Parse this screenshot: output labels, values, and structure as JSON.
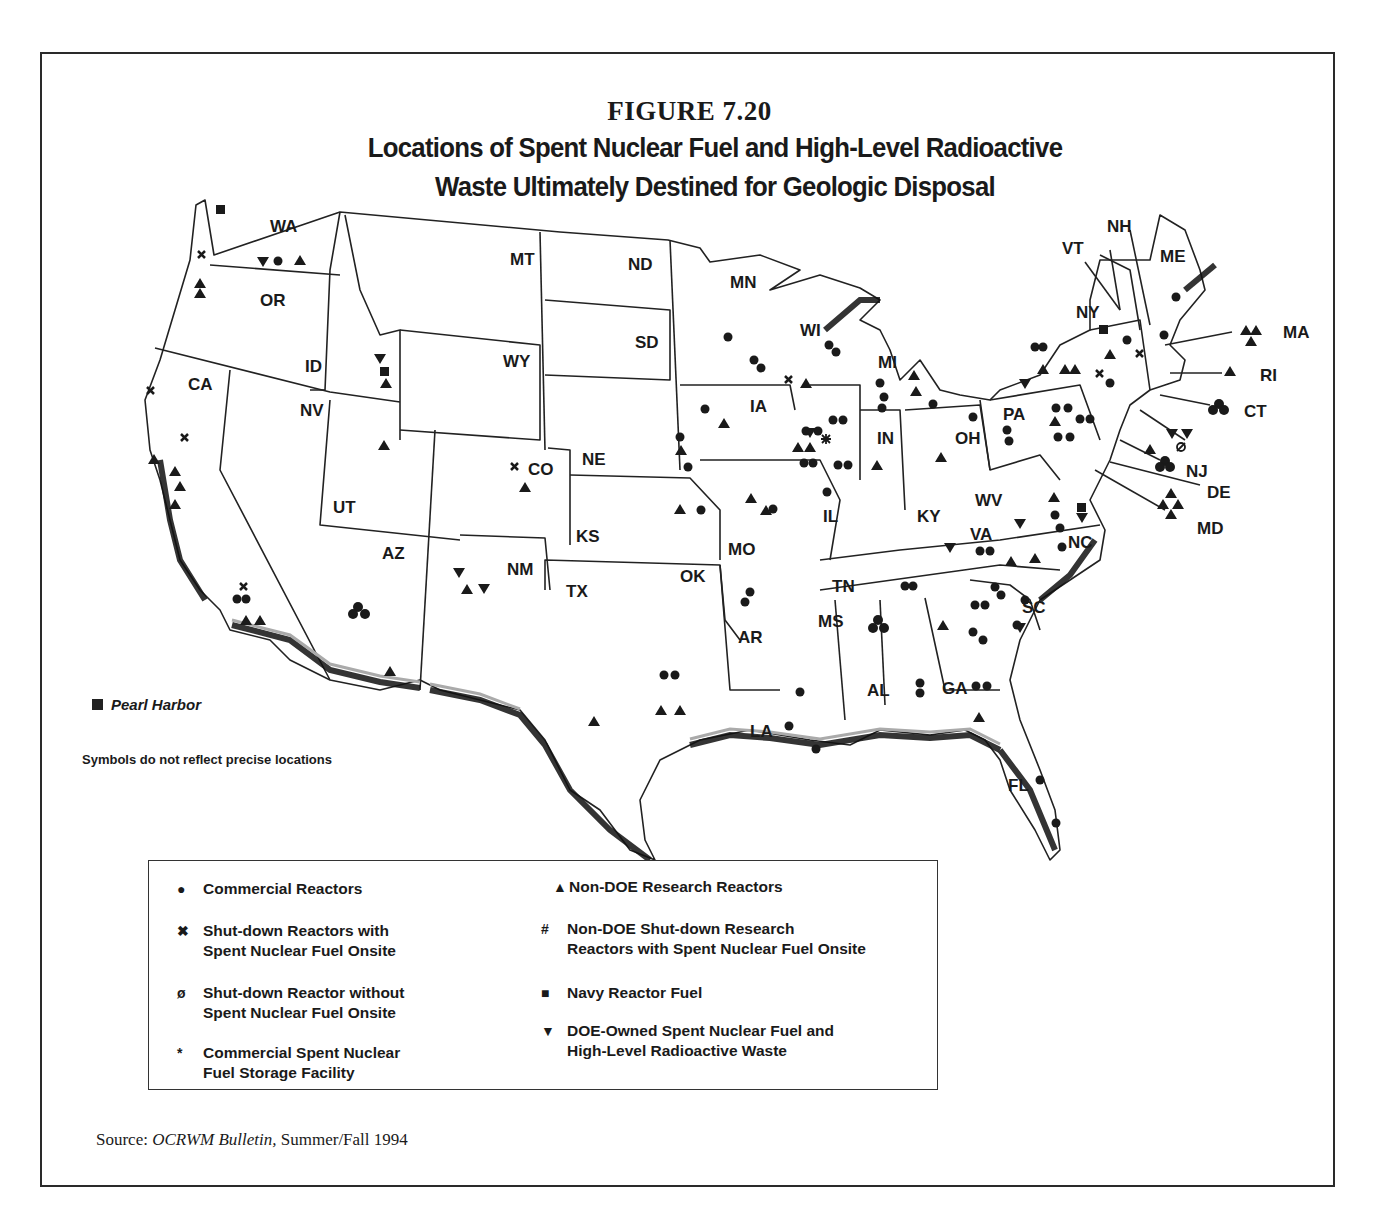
{
  "figure": {
    "number": "FIGURE 7.20",
    "title_line1": "Locations of Spent Nuclear Fuel and High-Level Radioactive",
    "title_line2": "Waste Ultimately Destined for Geologic Disposal"
  },
  "map": {
    "state_labels": [
      {
        "abbr": "WA",
        "x": 270,
        "y": 232
      },
      {
        "abbr": "OR",
        "x": 260,
        "y": 306
      },
      {
        "abbr": "CA",
        "x": 188,
        "y": 390
      },
      {
        "abbr": "ID",
        "x": 305,
        "y": 372
      },
      {
        "abbr": "NV",
        "x": 300,
        "y": 416
      },
      {
        "abbr": "MT",
        "x": 510,
        "y": 265
      },
      {
        "abbr": "WY",
        "x": 503,
        "y": 367
      },
      {
        "abbr": "UT",
        "x": 333,
        "y": 513
      },
      {
        "abbr": "AZ",
        "x": 382,
        "y": 559
      },
      {
        "abbr": "CO",
        "x": 528,
        "y": 475
      },
      {
        "abbr": "NM",
        "x": 507,
        "y": 575
      },
      {
        "abbr": "ND",
        "x": 628,
        "y": 270
      },
      {
        "abbr": "SD",
        "x": 635,
        "y": 348
      },
      {
        "abbr": "NE",
        "x": 582,
        "y": 465
      },
      {
        "abbr": "KS",
        "x": 576,
        "y": 542
      },
      {
        "abbr": "OK",
        "x": 680,
        "y": 582
      },
      {
        "abbr": "TX",
        "x": 566,
        "y": 597
      },
      {
        "abbr": "MN",
        "x": 730,
        "y": 288
      },
      {
        "abbr": "IA",
        "x": 750,
        "y": 412
      },
      {
        "abbr": "MO",
        "x": 728,
        "y": 555
      },
      {
        "abbr": "AR",
        "x": 738,
        "y": 643
      },
      {
        "abbr": "LA",
        "x": 750,
        "y": 737
      },
      {
        "abbr": "WI",
        "x": 800,
        "y": 336
      },
      {
        "abbr": "IL",
        "x": 823,
        "y": 522
      },
      {
        "abbr": "MI",
        "x": 878,
        "y": 368
      },
      {
        "abbr": "IN",
        "x": 877,
        "y": 444
      },
      {
        "abbr": "MS",
        "x": 818,
        "y": 627
      },
      {
        "abbr": "TN",
        "x": 832,
        "y": 592
      },
      {
        "abbr": "AL",
        "x": 867,
        "y": 696
      },
      {
        "abbr": "KY",
        "x": 917,
        "y": 522
      },
      {
        "abbr": "OH",
        "x": 955,
        "y": 444
      },
      {
        "abbr": "GA",
        "x": 942,
        "y": 694
      },
      {
        "abbr": "FL",
        "x": 1008,
        "y": 791
      },
      {
        "abbr": "WV",
        "x": 975,
        "y": 506
      },
      {
        "abbr": "VA",
        "x": 970,
        "y": 540
      },
      {
        "abbr": "NC",
        "x": 1068,
        "y": 548
      },
      {
        "abbr": "SC",
        "x": 1022,
        "y": 613
      },
      {
        "abbr": "PA",
        "x": 1003,
        "y": 420
      },
      {
        "abbr": "NY",
        "x": 1076,
        "y": 318
      },
      {
        "abbr": "VT",
        "x": 1062,
        "y": 254
      },
      {
        "abbr": "NH",
        "x": 1107,
        "y": 232
      },
      {
        "abbr": "ME",
        "x": 1160,
        "y": 262
      },
      {
        "abbr": "MA",
        "x": 1283,
        "y": 338
      },
      {
        "abbr": "RI",
        "x": 1260,
        "y": 381
      },
      {
        "abbr": "CT",
        "x": 1244,
        "y": 417
      },
      {
        "abbr": "NJ",
        "x": 1186,
        "y": 477
      },
      {
        "abbr": "DE",
        "x": 1207,
        "y": 498
      },
      {
        "abbr": "MD",
        "x": 1197,
        "y": 534
      }
    ],
    "pearl_harbor_label": "Pearl Harbor",
    "disclaimer": "Symbols do not reflect precise locations"
  },
  "legend": {
    "items": [
      {
        "symbol": "●",
        "icon": "circle-icon",
        "label_line1": "Commercial Reactors",
        "label_line2": ""
      },
      {
        "symbol": "✖",
        "icon": "x-icon",
        "label_line1": "Shut-down Reactors with",
        "label_line2": "Spent Nuclear Fuel Onsite"
      },
      {
        "symbol": "ø",
        "icon": "slashed-circle-icon",
        "label_line1": "Shut-down Reactor without",
        "label_line2": "Spent Nuclear Fuel Onsite"
      },
      {
        "symbol": "*",
        "icon": "asterisk-icon",
        "label_line1": "Commercial Spent Nuclear",
        "label_line2": "Fuel Storage Facility"
      },
      {
        "symbol": "▲",
        "icon": "triangle-up-icon",
        "label_line1": "Non-DOE Research Reactors",
        "label_line2": ""
      },
      {
        "symbol": "#",
        "icon": "hash-icon",
        "label_line1": "Non-DOE Shut-down Research",
        "label_line2": "Reactors with Spent Nuclear Fuel Onsite"
      },
      {
        "symbol": "■",
        "icon": "square-icon",
        "label_line1": "Navy Reactor Fuel",
        "label_line2": ""
      },
      {
        "symbol": "▼",
        "icon": "triangle-down-icon",
        "label_line1": "DOE-Owned Spent Nuclear Fuel and",
        "label_line2": "High-Level Radioactive Waste"
      }
    ]
  },
  "source": {
    "prefix": "Source: ",
    "publication": "OCRWM Bulletin,",
    "suffix": " Summer/Fall 1994"
  }
}
